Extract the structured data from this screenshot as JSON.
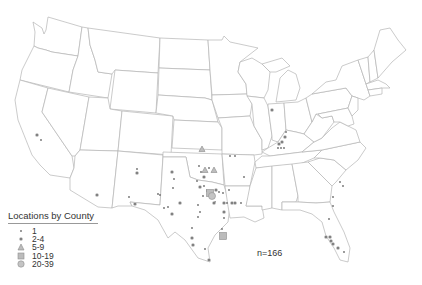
{
  "map": {
    "title": "Locations by County",
    "region": "Contiguous United States",
    "n_label": "n=166",
    "colors": {
      "state_stroke": "#b4b4b4",
      "marker_dark": "#6e6e6e",
      "marker_light": "#bdbdbd"
    }
  },
  "legend": {
    "title": "Locations by County",
    "items": [
      {
        "label": "1",
        "symbol": "small-dot"
      },
      {
        "label": "2-4",
        "symbol": "star-dot"
      },
      {
        "label": "5-9",
        "symbol": "triangle"
      },
      {
        "label": "10-19",
        "symbol": "square"
      },
      {
        "label": "20-39",
        "symbol": "circle"
      }
    ]
  },
  "markers": [
    {
      "x": 37,
      "y": 135,
      "cls": "2-4"
    },
    {
      "x": 41,
      "y": 140,
      "cls": "1"
    },
    {
      "x": 97,
      "y": 195,
      "cls": "2-4"
    },
    {
      "x": 129,
      "y": 197,
      "cls": "1"
    },
    {
      "x": 137,
      "y": 169,
      "cls": "1"
    },
    {
      "x": 137,
      "y": 173,
      "cls": "2-4"
    },
    {
      "x": 135,
      "y": 204,
      "cls": "2-4"
    },
    {
      "x": 158,
      "y": 194,
      "cls": "1"
    },
    {
      "x": 202,
      "y": 149,
      "cls": "5-9"
    },
    {
      "x": 230,
      "y": 156,
      "cls": "1"
    },
    {
      "x": 235,
      "y": 156,
      "cls": "1"
    },
    {
      "x": 172,
      "y": 172,
      "cls": "2-4"
    },
    {
      "x": 174,
      "y": 179,
      "cls": "1"
    },
    {
      "x": 173,
      "y": 188,
      "cls": "1"
    },
    {
      "x": 160,
      "y": 195,
      "cls": "1"
    },
    {
      "x": 199,
      "y": 166,
      "cls": "1"
    },
    {
      "x": 201,
      "y": 172,
      "cls": "1"
    },
    {
      "x": 205,
      "y": 170,
      "cls": "5-9"
    },
    {
      "x": 209,
      "y": 168,
      "cls": "1"
    },
    {
      "x": 214,
      "y": 170,
      "cls": "5-9"
    },
    {
      "x": 204,
      "y": 177,
      "cls": "2-4"
    },
    {
      "x": 197,
      "y": 181,
      "cls": "1"
    },
    {
      "x": 244,
      "y": 177,
      "cls": "1"
    },
    {
      "x": 200,
      "y": 187,
      "cls": "2-4"
    },
    {
      "x": 204,
      "y": 186,
      "cls": "1"
    },
    {
      "x": 207,
      "y": 191,
      "cls": "1"
    },
    {
      "x": 203,
      "y": 196,
      "cls": "1"
    },
    {
      "x": 210,
      "y": 193,
      "cls": "10-19"
    },
    {
      "x": 212,
      "y": 196,
      "cls": "20-39"
    },
    {
      "x": 216,
      "y": 190,
      "cls": "2-4"
    },
    {
      "x": 219,
      "y": 192,
      "cls": "1"
    },
    {
      "x": 223,
      "y": 193,
      "cls": "1"
    },
    {
      "x": 229,
      "y": 190,
      "cls": "1"
    },
    {
      "x": 215,
      "y": 202,
      "cls": "1"
    },
    {
      "x": 180,
      "y": 203,
      "cls": "2-4"
    },
    {
      "x": 164,
      "y": 208,
      "cls": "1"
    },
    {
      "x": 168,
      "y": 207,
      "cls": "1"
    },
    {
      "x": 172,
      "y": 214,
      "cls": "2-4"
    },
    {
      "x": 198,
      "y": 205,
      "cls": "1"
    },
    {
      "x": 200,
      "y": 212,
      "cls": "1"
    },
    {
      "x": 198,
      "y": 217,
      "cls": "1"
    },
    {
      "x": 214,
      "y": 203,
      "cls": "2-4"
    },
    {
      "x": 224,
      "y": 203,
      "cls": "2-4"
    },
    {
      "x": 227,
      "y": 203,
      "cls": "1"
    },
    {
      "x": 232,
      "y": 203,
      "cls": "2-4"
    },
    {
      "x": 235,
      "y": 203,
      "cls": "2-4"
    },
    {
      "x": 241,
      "y": 203,
      "cls": "1"
    },
    {
      "x": 224,
      "y": 212,
      "cls": "2-4"
    },
    {
      "x": 224,
      "y": 218,
      "cls": "1"
    },
    {
      "x": 222,
      "y": 229,
      "cls": "1"
    },
    {
      "x": 223,
      "y": 236,
      "cls": "10-19"
    },
    {
      "x": 192,
      "y": 228,
      "cls": "1"
    },
    {
      "x": 192,
      "y": 238,
      "cls": "2-4"
    },
    {
      "x": 193,
      "y": 245,
      "cls": "2-4"
    },
    {
      "x": 205,
      "y": 249,
      "cls": "1"
    },
    {
      "x": 209,
      "y": 260,
      "cls": "2-4"
    },
    {
      "x": 272,
      "y": 110,
      "cls": "2-4"
    },
    {
      "x": 282,
      "y": 142,
      "cls": "2-4"
    },
    {
      "x": 286,
      "y": 132,
      "cls": "1"
    },
    {
      "x": 285,
      "y": 137,
      "cls": "2-4"
    },
    {
      "x": 278,
      "y": 148,
      "cls": "1"
    },
    {
      "x": 279,
      "y": 144,
      "cls": "2-4"
    },
    {
      "x": 281,
      "y": 148,
      "cls": "1"
    },
    {
      "x": 284,
      "y": 148,
      "cls": "1"
    },
    {
      "x": 340,
      "y": 182,
      "cls": "1"
    },
    {
      "x": 343,
      "y": 186,
      "cls": "1"
    },
    {
      "x": 333,
      "y": 197,
      "cls": "1"
    },
    {
      "x": 333,
      "y": 206,
      "cls": "1"
    },
    {
      "x": 329,
      "y": 219,
      "cls": "1"
    },
    {
      "x": 326,
      "y": 237,
      "cls": "2-4"
    },
    {
      "x": 330,
      "y": 237,
      "cls": "2-4"
    },
    {
      "x": 331,
      "y": 241,
      "cls": "2-4"
    },
    {
      "x": 333,
      "y": 244,
      "cls": "2-4"
    },
    {
      "x": 338,
      "y": 248,
      "cls": "2-4"
    },
    {
      "x": 344,
      "y": 252,
      "cls": "1"
    }
  ]
}
